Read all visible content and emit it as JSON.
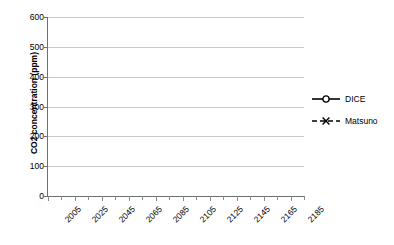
{
  "chart_data": {
    "type": "line",
    "title": "",
    "xlabel": "",
    "ylabel": "CO2 concentration (ppm)",
    "ylim": [
      0,
      600
    ],
    "ytick_step": 100,
    "yticks": [
      0,
      100,
      200,
      300,
      400,
      500,
      600
    ],
    "xlim": [
      2005,
      2195
    ],
    "xticks": [
      2005,
      2025,
      2045,
      2065,
      2085,
      2105,
      2125,
      2145,
      2165,
      2185
    ],
    "x_minor_step": 10,
    "grid": "horizontal",
    "legend_position": "right",
    "x": [
      2005,
      2015,
      2025,
      2035,
      2045,
      2055,
      2065,
      2075,
      2085,
      2095,
      2105,
      2115,
      2125,
      2135,
      2145,
      2155,
      2165,
      2175,
      2185,
      2195
    ],
    "series": [
      {
        "name": "DICE",
        "marker": "circle-open",
        "line": "solid",
        "color": "#000000",
        "values": [
          379,
          404,
          432,
          457,
          475,
          486,
          491,
          490,
          486,
          481,
          475,
          468,
          461,
          453,
          445,
          437,
          428,
          420,
          411,
          402
        ]
      },
      {
        "name": "Matsuno",
        "marker": "cross-x",
        "line": "dashed",
        "color": "#000000",
        "values": [
          379,
          401,
          424,
          445,
          460,
          470,
          476,
          478,
          478,
          477,
          474,
          471,
          467,
          463,
          459,
          454,
          450,
          445,
          439,
          433
        ]
      }
    ]
  },
  "axes": {
    "y_title": "CO2 concentration (ppm)",
    "y_tick_labels": [
      "600",
      "500",
      "400",
      "300",
      "200",
      "100",
      "0"
    ],
    "x_tick_labels": [
      "2005",
      "2025",
      "2045",
      "2065",
      "2085",
      "2105",
      "2125",
      "2145",
      "2165",
      "2185"
    ]
  },
  "legend": {
    "entries": [
      {
        "label": "DICE",
        "marker": "circle-open-icon",
        "line_style": "solid"
      },
      {
        "label": "Matsuno",
        "marker": "cross-x-icon",
        "line_style": "dashed"
      }
    ]
  },
  "colors": {
    "series": "#000000",
    "gridline": "#c9c9c9",
    "axis": "#6f6f6f",
    "background": "#ffffff",
    "text": "#000000"
  }
}
